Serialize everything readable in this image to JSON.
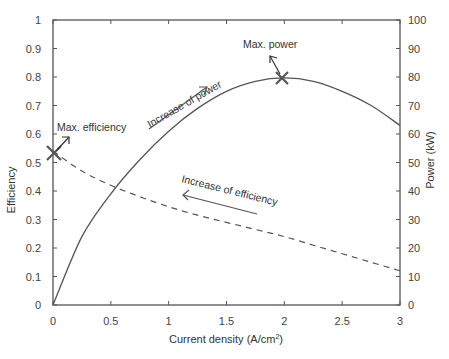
{
  "chart_data": {
    "type": "line",
    "title": "",
    "xlabel": "Current density (A/cm2)",
    "xlabel_main": "Current density (A/cm",
    "xlabel_sup": "2",
    "xlabel_tail": ")",
    "ylabel": "Efficiency",
    "y2label": "Power (kW)",
    "xlim": [
      0,
      3
    ],
    "ylim": [
      0,
      1
    ],
    "y2lim": [
      0,
      100
    ],
    "grid": false,
    "legend": "none",
    "x_ticks": [
      "0",
      "0.5",
      "1",
      "1.5",
      "2",
      "2.5",
      "3"
    ],
    "y_ticks": [
      "0",
      "0.1",
      "0.2",
      "0.3",
      "0.4",
      "0.5",
      "0.6",
      "0.7",
      "0.8",
      "0.9",
      "1"
    ],
    "y2_ticks": [
      "0",
      "10",
      "20",
      "30",
      "40",
      "50",
      "60",
      "70",
      "80",
      "90",
      "100"
    ],
    "series": [
      {
        "name": "Efficiency",
        "axis": "left",
        "style": "dashed",
        "x": [
          0,
          0.25,
          0.5,
          0.75,
          1.0,
          1.25,
          1.5,
          1.75,
          2.0,
          2.25,
          2.5,
          2.75,
          3.0
        ],
        "values": [
          0.54,
          0.47,
          0.42,
          0.38,
          0.345,
          0.315,
          0.29,
          0.265,
          0.24,
          0.21,
          0.18,
          0.15,
          0.12
        ]
      },
      {
        "name": "Power",
        "axis": "right",
        "unit": "kW",
        "style": "solid",
        "x": [
          0,
          0.25,
          0.5,
          0.75,
          1.0,
          1.25,
          1.5,
          1.75,
          2.0,
          2.25,
          2.5,
          2.75,
          3.0
        ],
        "values": [
          0,
          24,
          39,
          51,
          61,
          69,
          75,
          78.5,
          79.7,
          78.5,
          75,
          70,
          63
        ]
      }
    ],
    "annotations": [
      {
        "text": "Max. efficiency",
        "x": 0,
        "y": 0.54,
        "marker": "x"
      },
      {
        "text": "Max. power",
        "x": 2.0,
        "y": 79.7,
        "marker": "x"
      },
      {
        "text": "Increase of power",
        "arrow": "up-right"
      },
      {
        "text": "Increase of efficiency",
        "arrow": "left"
      }
    ]
  }
}
